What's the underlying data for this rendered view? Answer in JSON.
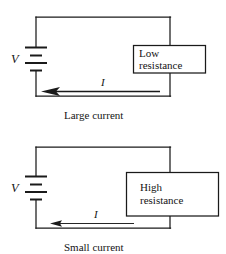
{
  "figure": {
    "line_color": "#1a1a1a",
    "background_color": "#ffffff"
  },
  "circuits": [
    {
      "id": "low-resistance-circuit",
      "source_label": "V",
      "current_label": "I",
      "resistor_line1": "Low",
      "resistor_line2": "resistance",
      "caption": "Large current",
      "current_magnitude": "large"
    },
    {
      "id": "high-resistance-circuit",
      "source_label": "V",
      "current_label": "I",
      "resistor_line1": "High",
      "resistor_line2": "resistance",
      "caption": "Small current",
      "current_magnitude": "small"
    }
  ]
}
